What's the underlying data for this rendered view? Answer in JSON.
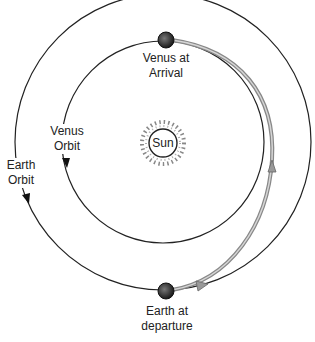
{
  "diagram": {
    "sun": {
      "label": "Sun"
    },
    "orbits": [
      {
        "name": "Venus Orbit",
        "line1": "Venus",
        "line2": "Orbit"
      },
      {
        "name": "Earth Orbit",
        "line1": "Earth",
        "line2": "Orbit"
      }
    ],
    "planets": [
      {
        "name": "Venus at Arrival",
        "line1": "Venus at",
        "line2": "Arrival"
      },
      {
        "name": "Earth at departure",
        "line1": "Earth at",
        "line2": "departure"
      }
    ],
    "colors": {
      "orbit_line": "#222222",
      "transfer_path": "#9a9a9a",
      "planet": "#333333",
      "background": "#ffffff"
    }
  }
}
